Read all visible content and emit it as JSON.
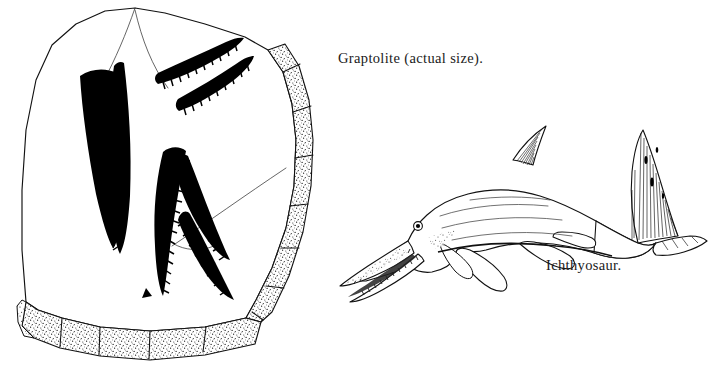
{
  "plate": {
    "width": 714,
    "height": 374,
    "background_color": "#ffffff",
    "ink_color": "#000000",
    "style": "black-and-white engraved line illustration",
    "title": "Fossil Illustration Plate"
  },
  "captions": {
    "graptolite": "Graptolite (actual size).",
    "ichthyosaur": "Ichthyosaur."
  },
  "figures": {
    "rock_slab": {
      "name": "rock slab with graptolite fossils",
      "edge_texture": "stippled",
      "fossil_count": 5,
      "fossil_description": "elongated saw-toothed black graptolite rhabdosomes",
      "crack_lines": 3
    },
    "ichthyosaur": {
      "name": "ichthyosaur marine reptile",
      "features": [
        "long toothed snout",
        "round eye",
        "triangular dorsal fin",
        "two paddle flippers",
        "crescent tail fin",
        "stippled belly shading"
      ]
    }
  }
}
